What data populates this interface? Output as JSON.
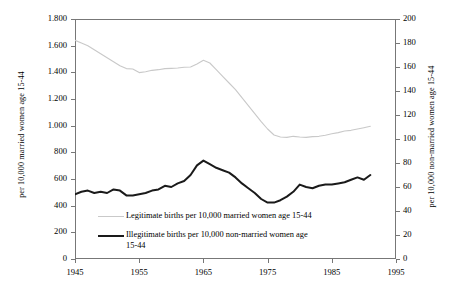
{
  "chart_data": {
    "type": "line",
    "title": "",
    "xlabel": "",
    "ylabel": "per 10,000 married women age 15-44",
    "y2label": "per 10,000 non-married women age 15-44",
    "xlim": [
      1945,
      1995
    ],
    "ylim": [
      0,
      1800
    ],
    "y2lim": [
      0,
      200
    ],
    "grid": false,
    "legend_position": "inside-lower-left",
    "x_ticks": [
      "1945",
      "1955",
      "1965",
      "1975",
      "1985",
      "1995"
    ],
    "x_tick_values": [
      1945,
      1955,
      1965,
      1975,
      1985,
      1995
    ],
    "y_ticks": [
      "0",
      "200",
      "400",
      "600",
      "800",
      "1.000",
      "1.200",
      "1.400",
      "1.600",
      "1.800"
    ],
    "y_tick_values": [
      0,
      200,
      400,
      600,
      800,
      1000,
      1200,
      1400,
      1600,
      1800
    ],
    "y2_ticks": [
      "0",
      "20",
      "40",
      "60",
      "80",
      "100",
      "120",
      "140",
      "160",
      "180",
      "200"
    ],
    "y2_tick_values": [
      0,
      20,
      40,
      60,
      80,
      100,
      120,
      140,
      160,
      180,
      200
    ],
    "series": [
      {
        "name": "Legitimate births per 10,000 married women age 15-44",
        "axis": "left",
        "color": "#c9c9c9",
        "width": 1.1,
        "x": [
          1945,
          1946,
          1947,
          1948,
          1949,
          1950,
          1951,
          1952,
          1953,
          1954,
          1955,
          1956,
          1957,
          1958,
          1959,
          1960,
          1961,
          1962,
          1963,
          1964,
          1965,
          1966,
          1967,
          1968,
          1969,
          1970,
          1971,
          1972,
          1973,
          1974,
          1975,
          1976,
          1977,
          1978,
          1979,
          1980,
          1981,
          1982,
          1983,
          1984,
          1985,
          1986,
          1987,
          1988,
          1989,
          1990,
          1991
        ],
        "values": [
          1640,
          1620,
          1600,
          1570,
          1540,
          1510,
          1480,
          1450,
          1428,
          1425,
          1398,
          1405,
          1415,
          1420,
          1428,
          1430,
          1432,
          1438,
          1440,
          1462,
          1490,
          1470,
          1420,
          1370,
          1320,
          1270,
          1210,
          1150,
          1090,
          1030,
          975,
          930,
          915,
          912,
          920,
          915,
          912,
          918,
          920,
          928,
          940,
          948,
          960,
          965,
          975,
          985,
          995
        ]
      },
      {
        "name": "Illegitimate births per 10,000 non-married women age 15-44",
        "axis": "right",
        "color": "#1a1a1a",
        "width": 2.0,
        "x": [
          1945,
          1946,
          1947,
          1948,
          1949,
          1950,
          1951,
          1952,
          1953,
          1954,
          1955,
          1956,
          1957,
          1958,
          1959,
          1960,
          1961,
          1962,
          1963,
          1964,
          1965,
          1966,
          1967,
          1968,
          1969,
          1970,
          1971,
          1972,
          1973,
          1974,
          1975,
          1976,
          1977,
          1978,
          1979,
          1980,
          1981,
          1982,
          1983,
          1984,
          1985,
          1986,
          1987,
          1988,
          1989,
          1990,
          1991
        ],
        "values": [
          54,
          56,
          57,
          55,
          56,
          55,
          58,
          57,
          53,
          53,
          54,
          55,
          57,
          58,
          61,
          60,
          63,
          65,
          70,
          78,
          82,
          79,
          76,
          74,
          72,
          68,
          63,
          59,
          55,
          50,
          47,
          47,
          49,
          52,
          56,
          62,
          60,
          59,
          61,
          62,
          62,
          63,
          64,
          66,
          68,
          66,
          70
        ]
      }
    ],
    "legend": [
      {
        "label": "Legitimate births per 10,000 married women age 15-44",
        "color": "#c9c9c9",
        "style": "thin"
      },
      {
        "label": "Illegitimate births per 10,000 non-married women age",
        "label_line2": "15-44",
        "color": "#1a1a1a",
        "style": "thick"
      }
    ]
  }
}
